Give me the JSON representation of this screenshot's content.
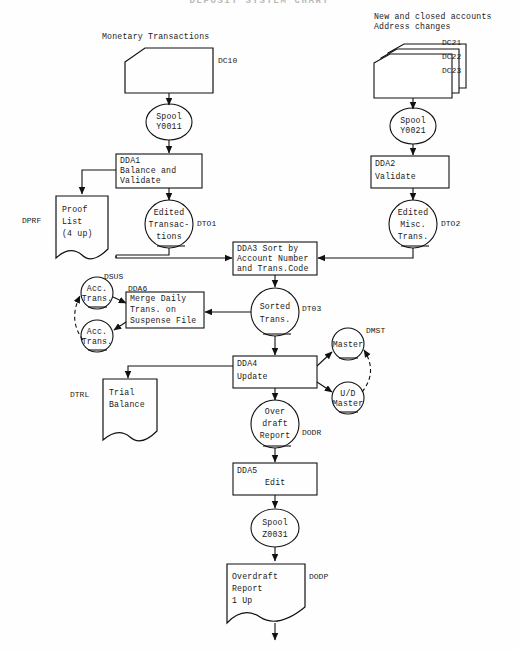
{
  "title": "DEPOSIT SYSTEM CHART",
  "diagram": {
    "type": "flowchart",
    "nodes": [
      {
        "id": "n1",
        "kind": "input-card",
        "caption": "Monetary Transactions",
        "tag": "DC10",
        "text": ""
      },
      {
        "id": "n2",
        "kind": "input-card-stack",
        "caption": "New and closed accounts\nAddress changes",
        "tags": [
          "DC21",
          "DC22",
          "DC23"
        ],
        "text": ""
      },
      {
        "id": "n3",
        "kind": "tape",
        "text": "Spool\nY0011",
        "tag": ""
      },
      {
        "id": "n4",
        "kind": "tape",
        "text": "Spool\nY0021",
        "tag": ""
      },
      {
        "id": "n5",
        "kind": "process",
        "text": "DDA1\nBalance and\nValidate",
        "tag": ""
      },
      {
        "id": "n6",
        "kind": "process",
        "text": "DDA2\nValidate",
        "tag": ""
      },
      {
        "id": "n7",
        "kind": "document",
        "text": "Proof\nList\n(4 up)",
        "tag": "DPRF"
      },
      {
        "id": "n8",
        "kind": "tape",
        "text": "Edited\nTransac-\ntions",
        "tag": "DTO1"
      },
      {
        "id": "n9",
        "kind": "tape",
        "text": "Edited\nMisc.\nTrans.",
        "tag": "DTO2"
      },
      {
        "id": "n10",
        "kind": "process",
        "text": "DDA3 Sort by\nAccount Number\nand Trans.Code",
        "tag": ""
      },
      {
        "id": "n11",
        "kind": "tape",
        "text": "Sorted\nTrans.",
        "tag": "DT03"
      },
      {
        "id": "n12",
        "kind": "process",
        "text": "Merge Daily\nTrans. on\nSuspense File",
        "tag": "DDA6"
      },
      {
        "id": "n13",
        "kind": "tape-small",
        "text": "Acc.\nTrans.",
        "tag": "DSUS"
      },
      {
        "id": "n14",
        "kind": "tape-small",
        "text": "Acc.\nTrans.",
        "tag": ""
      },
      {
        "id": "n15",
        "kind": "process",
        "text": "DDA4\nUpdate",
        "tag": ""
      },
      {
        "id": "n16",
        "kind": "tape-small",
        "text": "Master",
        "tag": "DMST"
      },
      {
        "id": "n17",
        "kind": "tape-small",
        "text": "U/D\nMaster",
        "tag": ""
      },
      {
        "id": "n18",
        "kind": "document",
        "text": "Trial\nBalance",
        "tag": "DTRL"
      },
      {
        "id": "n19",
        "kind": "tape",
        "text": "Over\ndraft\nReport",
        "tag": "DODR"
      },
      {
        "id": "n20",
        "kind": "process",
        "text": "DDA5\nEdit",
        "tag": ""
      },
      {
        "id": "n21",
        "kind": "tape",
        "text": "Spool\nZ0031",
        "tag": ""
      },
      {
        "id": "n22",
        "kind": "document",
        "text": "Overdraft\nReport\n1 Up",
        "tag": "DODP"
      }
    ],
    "labels": {
      "monetary_transactions": "Monetary Transactions",
      "dc10": "DC10",
      "new_closed_line1": "New and closed accounts",
      "new_closed_line2": "Address changes",
      "dc21": "DC21",
      "dc22": "DC22",
      "dc23": "DC23",
      "spool_y0011_l1": "Spool",
      "spool_y0011_l2": "Y0011",
      "spool_y0021_l1": "Spool",
      "spool_y0021_l2": "Y0021",
      "dda1_l1": "DDA1",
      "dda1_l2": "Balance and",
      "dda1_l3": "Validate",
      "dda2_l1": "DDA2",
      "dda2_l2": "Validate",
      "dprf": "DPRF",
      "proof_l1": "Proof",
      "proof_l2": "List",
      "proof_l3": "(4 up)",
      "edited_trans_l1": "Edited",
      "edited_trans_l2": "Transac-",
      "edited_trans_l3": "tions",
      "dto1": "DTO1",
      "edited_misc_l1": "Edited",
      "edited_misc_l2": "Misc.",
      "edited_misc_l3": "Trans.",
      "dto2": "DTO2",
      "dda3_l1": "DDA3 Sort by",
      "dda3_l2": "Account Number",
      "dda3_l3": "and Trans.Code",
      "sorted_l1": "Sorted",
      "sorted_l2": "Trans.",
      "dt03": "DT03",
      "dsus": "DSUS",
      "dda6": "DDA6",
      "acc_trans_l1": "Acc.",
      "acc_trans_l2": "Trans.",
      "merge_l1": "Merge Daily",
      "merge_l2": "Trans. on",
      "merge_l3": "Suspense File",
      "dda4_l1": "DDA4",
      "dda4_l2": "Update",
      "dmst": "DMST",
      "master": "Master",
      "ud_l1": "U/D",
      "ud_l2": "Master",
      "dtrl": "DTRL",
      "trial_l1": "Trial",
      "trial_l2": "Balance",
      "over_l1": "Over",
      "over_l2": "draft",
      "over_l3": "Report",
      "dodr": "DODR",
      "dda5_l1": "DDA5",
      "dda5_l2": "Edit",
      "spool_z_l1": "Spool",
      "spool_z_l2": "Z0031",
      "overdraft_l1": "Overdraft",
      "overdraft_l2": "Report",
      "overdraft_l3": "1 Up",
      "dodp": "DODP"
    }
  }
}
